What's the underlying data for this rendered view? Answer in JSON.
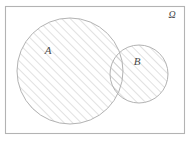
{
  "figure": {
    "type": "venn-diagram",
    "background_color": "#ffffff",
    "stroke_color": "#b3b3b3",
    "hatch_color": "#bdbdbd",
    "label_color": "#4a4a4a",
    "universe": {
      "label": "Ω",
      "x": 5,
      "y": 6,
      "width": 179,
      "height": 127,
      "label_x": 172,
      "label_y": 18
    },
    "sets": [
      {
        "label": "A",
        "cx": 70,
        "cy": 71,
        "r": 53,
        "shaded": true,
        "label_x": 48,
        "label_y": 54
      },
      {
        "label": "B",
        "cx": 139,
        "cy": 74,
        "r": 29,
        "shaded": true,
        "label_x": 137,
        "label_y": 65
      }
    ],
    "hatch": {
      "angle_degrees": 45,
      "spacing_px": 6,
      "line_width": 0.9
    }
  }
}
